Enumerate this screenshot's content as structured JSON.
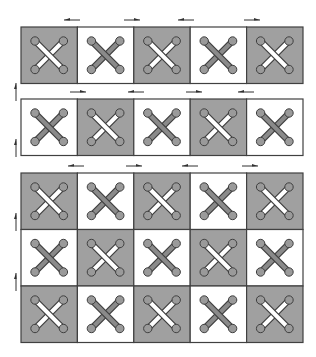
{
  "diagram": {
    "colors": {
      "shaded_cell": "#a0a0a0",
      "plain_cell": "#ffffff",
      "border": "#404040",
      "link_light": "#ffffff",
      "link_dark": "#8a8a8a",
      "joint": "#9a9a9a",
      "arrow": "#303030"
    },
    "blocks": [
      {
        "name": "block-1",
        "rows": [
          [
            "shaded",
            "plain",
            "shaded",
            "plain",
            "shaded"
          ]
        ],
        "top_arrows": [
          "left",
          "right",
          "left",
          "right"
        ]
      },
      {
        "name": "block-2",
        "rows": [
          [
            "plain",
            "shaded",
            "plain",
            "shaded",
            "plain"
          ]
        ],
        "top_arrows": [
          "right",
          "left",
          "right",
          "left"
        ]
      },
      {
        "name": "block-3",
        "rows": [
          [
            "shaded",
            "plain",
            "shaded",
            "plain",
            "shaded"
          ],
          [
            "plain",
            "shaded",
            "plain",
            "shaded",
            "plain"
          ],
          [
            "shaded",
            "plain",
            "shaded",
            "plain",
            "shaded"
          ]
        ],
        "top_arrows": [
          "left",
          "right",
          "left",
          "right"
        ]
      }
    ],
    "side_arrows": [
      "up",
      "up",
      "up",
      "up"
    ]
  }
}
